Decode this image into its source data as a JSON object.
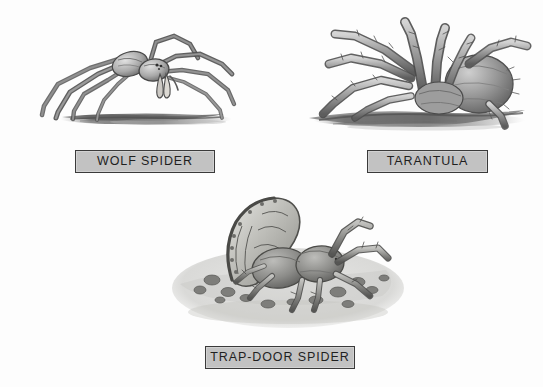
{
  "plate": {
    "background_color": "#fdfdfd",
    "width": 543,
    "height": 387,
    "medium": "pencil-and-ink illustration plate",
    "subject": "spiders"
  },
  "style": {
    "label_fill": "#c2c2c2",
    "label_border": "#3a3a3a",
    "label_text_color": "#1f1f1f",
    "ink_color": "#4a4a4a",
    "shade_color": "#8d8d8d",
    "ground_color": "#6e6e6e"
  },
  "figures": [
    {
      "id": "wolf-spider",
      "label": "WOLF SPIDER",
      "icon": "wolf-spider-illustration",
      "position": "top-left",
      "description": "Long-legged spider standing on a thin strip of ground"
    },
    {
      "id": "tarantula",
      "label": "TARANTULA",
      "icon": "tarantula-illustration",
      "position": "top-right",
      "description": "Stout hairy spider with thick bristled legs on a mound of soil"
    },
    {
      "id": "trap-door-spider",
      "label": "TRAP-DOOR SPIDER",
      "icon": "trap-door-spider-illustration",
      "position": "bottom-center",
      "description": "Spider emerging from a burrow with a hinged lid raised above it"
    }
  ]
}
